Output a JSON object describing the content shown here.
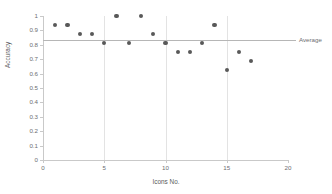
{
  "chart_data": {
    "type": "scatter",
    "title": "",
    "xlabel": "Icons No.",
    "ylabel": "Accuracy",
    "xlim": [
      0,
      20
    ],
    "ylim": [
      0,
      1
    ],
    "grid": true,
    "legend": "none",
    "x": [
      1,
      2,
      3,
      4,
      5,
      6,
      7,
      8,
      9,
      10,
      11,
      12,
      13,
      14,
      15,
      16,
      17
    ],
    "values": [
      0.9375,
      0.9375,
      0.875,
      0.875,
      0.8125,
      1.0,
      0.8125,
      1.0,
      0.875,
      0.8125,
      0.75,
      0.75,
      0.8125,
      0.9375,
      0.625,
      0.75,
      0.6875
    ],
    "xticks": [
      0,
      5,
      10,
      15,
      20
    ],
    "xtick_labels": [
      "0",
      "5",
      "10",
      "15",
      "20"
    ],
    "yticks": [
      0,
      0.1,
      0.2,
      0.3,
      0.4,
      0.5,
      0.6,
      0.7,
      0.8,
      0.9,
      1.0
    ],
    "ytick_labels": [
      "0",
      "0.1",
      "0.2",
      "0.3",
      "0.4",
      "0.5",
      "0.6",
      "0.7",
      "0.8",
      "0.9",
      "1"
    ],
    "annotations": [
      {
        "name": "average",
        "label": "Average",
        "type": "horizontal-line",
        "value": 0.8309
      }
    ],
    "marker_color": "#595959",
    "average_line_color": "#b6b6b6",
    "grid_color": "#e3e3e3",
    "axis_color": "#c9c9c9",
    "text_color": "#6d6e71"
  }
}
